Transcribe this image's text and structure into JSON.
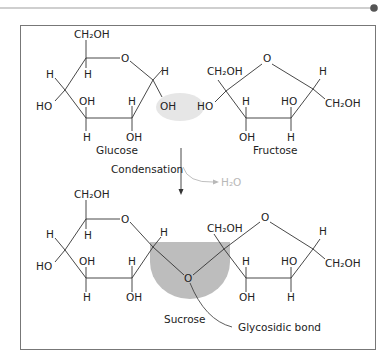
{
  "header": {
    "rule_color": "#9a9a9a",
    "dot_color": "#555555"
  },
  "frame": {
    "border_color": "#777777"
  },
  "top": {
    "glucose": {
      "name": "Glucose",
      "labels": [
        "CH₂OH",
        "O",
        "H",
        "H",
        "H",
        "HO",
        "OH",
        "H",
        "OH",
        "H",
        "OH"
      ]
    },
    "fructose": {
      "name": "Fructose",
      "labels": [
        "CH₂OH",
        "O",
        "HO",
        "H",
        "HO",
        "H",
        "CH₂OH",
        "OH",
        "H"
      ]
    },
    "water_highlight_color": "#e6e6e6"
  },
  "reaction": {
    "label": "Condensation",
    "byproduct": "H₂O",
    "byproduct_color": "#b8b8b8"
  },
  "bottom": {
    "name": "Sucrose",
    "bond_label": "Glycosidic bond",
    "bond_atom": "O",
    "highlight_color": "#bdbdbd"
  },
  "text": {
    "ch2oh": "CH₂OH",
    "o": "O",
    "h": "H",
    "oh": "OH",
    "ho": "HO"
  }
}
